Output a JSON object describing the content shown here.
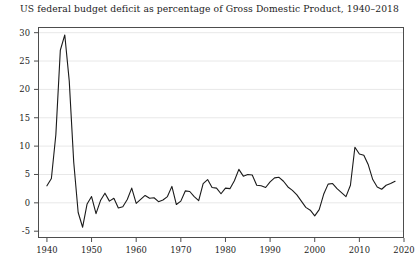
{
  "chart_data": {
    "type": "line",
    "title": "US federal budget deficit as percentage of Gross Domestic Product, 1940–2018",
    "xlabel": "",
    "ylabel": "",
    "xlim": [
      1938,
      2020
    ],
    "ylim": [
      -6.2,
      31.0
    ],
    "grid": "horizontal",
    "legend": "none",
    "x_ticks": [
      1940,
      1950,
      1960,
      1970,
      1980,
      1990,
      2000,
      2010,
      2020
    ],
    "x_tick_labels": [
      "1940",
      "1950",
      "1960",
      "1970",
      "1980",
      "1990",
      "2000",
      "2010",
      "2020"
    ],
    "y_ticks": [
      -5,
      0,
      5,
      10,
      15,
      20,
      25,
      30
    ],
    "y_tick_labels": [
      "-5",
      "0",
      "5",
      "10",
      "15",
      "20",
      "25",
      "30"
    ],
    "series": [
      {
        "name": "US federal budget deficit (% of GDP)",
        "color": "#1a1a1a",
        "line_width": 1.1,
        "x": [
          1940,
          1941,
          1942,
          1943,
          1944,
          1945,
          1946,
          1947,
          1948,
          1949,
          1950,
          1951,
          1952,
          1953,
          1954,
          1955,
          1956,
          1957,
          1958,
          1959,
          1960,
          1961,
          1962,
          1963,
          1964,
          1965,
          1966,
          1967,
          1968,
          1969,
          1970,
          1971,
          1972,
          1973,
          1974,
          1975,
          1976,
          1977,
          1978,
          1979,
          1980,
          1981,
          1982,
          1983,
          1984,
          1985,
          1986,
          1987,
          1988,
          1989,
          1990,
          1991,
          1992,
          1993,
          1994,
          1995,
          1996,
          1997,
          1998,
          1999,
          2000,
          2001,
          2002,
          2003,
          2004,
          2005,
          2006,
          2007,
          2008,
          2009,
          2010,
          2011,
          2012,
          2013,
          2014,
          2015,
          2016,
          2017,
          2018
        ],
        "values": [
          3.0,
          4.3,
          12.0,
          26.9,
          29.6,
          21.5,
          7.2,
          -1.7,
          -4.3,
          -0.2,
          1.1,
          -1.9,
          0.4,
          1.7,
          0.3,
          0.8,
          -0.9,
          -0.7,
          0.6,
          2.6,
          -0.1,
          0.6,
          1.3,
          0.8,
          0.9,
          0.2,
          0.5,
          1.1,
          2.9,
          -0.3,
          0.3,
          2.1,
          2.0,
          1.1,
          0.4,
          3.4,
          4.1,
          2.7,
          2.6,
          1.6,
          2.6,
          2.5,
          3.9,
          5.9,
          4.7,
          5.0,
          4.9,
          3.1,
          3.0,
          2.7,
          3.7,
          4.4,
          4.5,
          3.8,
          2.8,
          2.2,
          1.4,
          0.3,
          -0.8,
          -1.3,
          -2.3,
          -1.2,
          1.5,
          3.3,
          3.4,
          2.5,
          1.8,
          1.1,
          3.1,
          9.8,
          8.6,
          8.4,
          6.7,
          4.1,
          2.8,
          2.4,
          3.1,
          3.4,
          3.8
        ]
      }
    ]
  },
  "figure": {
    "title": "US federal budget deficit as percentage of Gross Domestic Product, 1940–2018",
    "background_color": "#ffffff",
    "axis_color": "#4d4d4d",
    "grid_color": "#e8e8e8",
    "line_color": "#1a1a1a"
  }
}
